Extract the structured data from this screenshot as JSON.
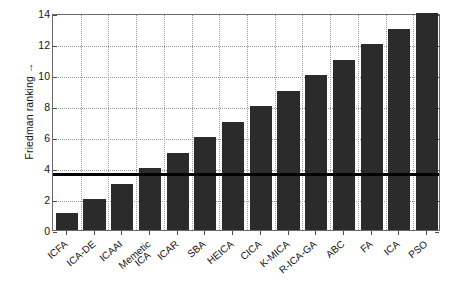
{
  "chart_data": {
    "type": "bar",
    "title": "",
    "xlabel": "",
    "ylabel": "Friedman ranking →",
    "ylim": [
      0,
      14
    ],
    "yticks": [
      0,
      2,
      4,
      6,
      8,
      10,
      12,
      14
    ],
    "grid": true,
    "legend": false,
    "bar_color": "#2b2b2b",
    "categories": [
      "ICFA",
      "ICA-DE",
      "ICAAI",
      "Memetic ICA",
      "ICAR",
      "SBA",
      "HEICA",
      "CICA",
      "K-MICA",
      "R-ICA-GA",
      "ABC",
      "FA",
      "ICA",
      "PSO"
    ],
    "category_lines": [
      [
        "ICFA"
      ],
      [
        "ICA-DE"
      ],
      [
        "ICAAI"
      ],
      [
        "Memetic",
        "ICA"
      ],
      [
        "ICAR"
      ],
      [
        "SBA"
      ],
      [
        "HEICA"
      ],
      [
        "CICA"
      ],
      [
        "K-MICA"
      ],
      [
        "R-ICA-GA"
      ],
      [
        "ABC"
      ],
      [
        "FA"
      ],
      [
        "ICA"
      ],
      [
        "PSO"
      ]
    ],
    "values": [
      1.1,
      2,
      3,
      4,
      5,
      6,
      7,
      8,
      9,
      10,
      11,
      12,
      13,
      14
    ],
    "annotations": [
      {
        "name": "critical-difference-line",
        "type": "hline",
        "y": 3.8,
        "color": "#000000"
      }
    ]
  }
}
